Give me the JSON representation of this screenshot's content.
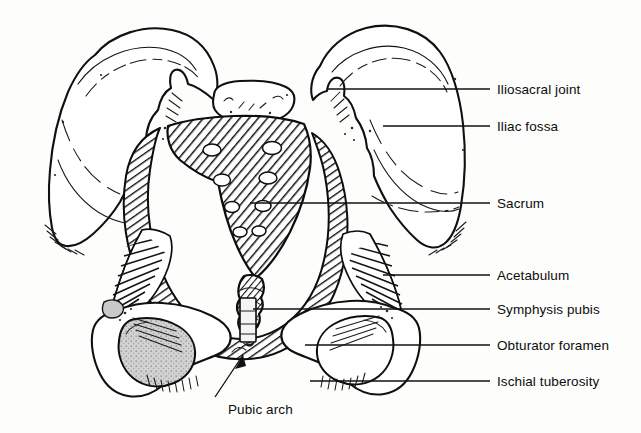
{
  "figure": {
    "background_color": "#fdfdfc",
    "ink_color": "#101010",
    "shade_color": "#cfcfcf",
    "width": 641,
    "height": 433
  },
  "labels": [
    {
      "id": "iliosacral-joint",
      "text": "Iliosacral joint",
      "text_x": 497,
      "text_y": 94,
      "leader_x1": 327,
      "leader_y1": 89,
      "leader_x2": 490,
      "leader_y2": 89
    },
    {
      "id": "iliac-fossa",
      "text": "Iliac fossa",
      "text_x": 497,
      "text_y": 131,
      "leader_x1": 383,
      "leader_y1": 126,
      "leader_x2": 490,
      "leader_y2": 126
    },
    {
      "id": "sacrum",
      "text": "Sacrum",
      "text_x": 497,
      "text_y": 208,
      "leader_x1": 250,
      "leader_y1": 203,
      "leader_x2": 490,
      "leader_y2": 203
    },
    {
      "id": "acetabulum",
      "text": "Acetabulum",
      "text_x": 497,
      "text_y": 280,
      "leader_x1": 383,
      "leader_y1": 275,
      "leader_x2": 490,
      "leader_y2": 275
    },
    {
      "id": "symphysis-pubis",
      "text": "Symphysis pubis",
      "text_x": 497,
      "text_y": 314,
      "leader_x1": 253,
      "leader_y1": 309,
      "leader_x2": 490,
      "leader_y2": 309
    },
    {
      "id": "obturator-foramen",
      "text": "Obturator foramen",
      "text_x": 497,
      "text_y": 350,
      "leader_x1": 305,
      "leader_y1": 345,
      "leader_x2": 490,
      "leader_y2": 345
    },
    {
      "id": "ischial-tuberosity",
      "text": "Ischial tuberosity",
      "text_x": 497,
      "text_y": 386,
      "leader_x1": 310,
      "leader_y1": 381,
      "leader_x2": 490,
      "leader_y2": 381
    }
  ],
  "bottom_label": {
    "id": "pubic-arch",
    "text": "Pubic arch",
    "text_x": 228,
    "text_y": 414,
    "arrow_tail_x": 215,
    "arrow_tail_y": 397,
    "arrow_head_x": 243,
    "arrow_head_y": 355
  },
  "structures": [
    {
      "id": "left-ilium",
      "name": "Left ilium",
      "fill": "white",
      "texture": "outline"
    },
    {
      "id": "right-ilium",
      "name": "Right ilium",
      "fill": "white",
      "texture": "outline"
    },
    {
      "id": "sacrum",
      "name": "Sacrum",
      "fill": "white",
      "texture": "diagonal-hatch"
    },
    {
      "id": "coccyx",
      "name": "Coccyx",
      "fill": "white",
      "texture": "diagonal-hatch"
    },
    {
      "id": "l5-vertebra",
      "name": "L5 vertebra",
      "fill": "white",
      "texture": "outline"
    },
    {
      "id": "pelvic-brim",
      "name": "Pelvic brim",
      "fill": "white",
      "texture": "diagonal-hatch"
    },
    {
      "id": "left-acetabulum",
      "name": "Left acetabulum",
      "fill": "white",
      "texture": "radial-hatch"
    },
    {
      "id": "right-acetabulum",
      "name": "Right acetabulum",
      "fill": "white",
      "texture": "radial-hatch"
    },
    {
      "id": "left-obturator-foramen",
      "name": "Left obturator foramen",
      "fill": "#cfcfcf",
      "texture": "stipple"
    },
    {
      "id": "right-obturator-foramen",
      "name": "Right obturator foramen",
      "fill": "white",
      "texture": "outline"
    },
    {
      "id": "symphysis-pubis",
      "name": "Symphysis pubis",
      "fill": "#f4f4f4",
      "texture": "cross-bands"
    },
    {
      "id": "left-ischial-tuberosity",
      "name": "Left ischial tuberosity",
      "fill": "white",
      "texture": "comb-hatch"
    },
    {
      "id": "right-ischial-tuberosity",
      "name": "Right ischial tuberosity",
      "fill": "white",
      "texture": "comb-hatch"
    }
  ],
  "sacral_foramina": {
    "count": 8,
    "description": "Four pairs of anterior sacral foramina",
    "points": [
      {
        "cx": 212,
        "cy": 150,
        "rx": 9,
        "ry": 6
      },
      {
        "cx": 272,
        "cy": 148,
        "rx": 9.5,
        "ry": 6.5
      },
      {
        "cx": 222,
        "cy": 180,
        "rx": 8.5,
        "ry": 6
      },
      {
        "cx": 268,
        "cy": 178,
        "rx": 9,
        "ry": 6
      },
      {
        "cx": 232,
        "cy": 207,
        "rx": 7.5,
        "ry": 5.5
      },
      {
        "cx": 263,
        "cy": 206,
        "rx": 8,
        "ry": 5.5
      },
      {
        "cx": 240,
        "cy": 232,
        "rx": 7,
        "ry": 5
      },
      {
        "cx": 259,
        "cy": 231,
        "rx": 7,
        "ry": 5
      }
    ]
  }
}
